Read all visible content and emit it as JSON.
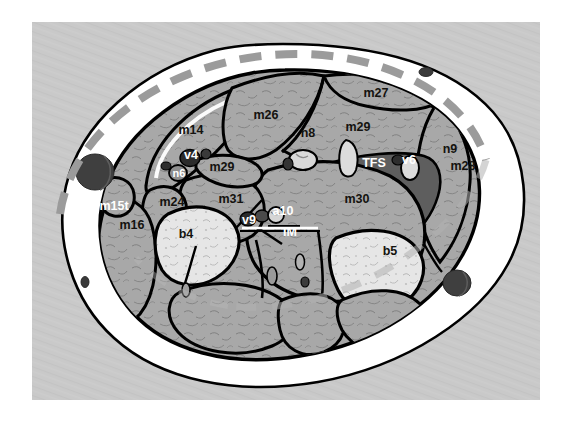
{
  "figure": {
    "background_color": "#ffffff",
    "panel_color": "#c9c9c9",
    "panel_rect": {
      "x": 32,
      "y": 22,
      "width": 508,
      "height": 378
    },
    "outline_color": "#000000",
    "skin_fill": "#ffffff",
    "muscle_fill": "#a8a8a8",
    "bone_fill": "#e3e3e3",
    "fascia_fill": "#6f6f6f",
    "vessel_dark": "#3a3a3a",
    "dashed_marker_color": "#9b9b9b"
  },
  "labels": {
    "dark": [
      {
        "id": "m14",
        "text": "m14",
        "x": 191,
        "y": 134
      },
      {
        "id": "m26",
        "text": "m26",
        "x": 266,
        "y": 119
      },
      {
        "id": "m27",
        "text": "m27",
        "x": 376,
        "y": 97
      },
      {
        "id": "n8",
        "text": "n8",
        "x": 308,
        "y": 137
      },
      {
        "id": "m29-upper",
        "text": "m29",
        "x": 358,
        "y": 131
      },
      {
        "id": "n9",
        "text": "n9",
        "x": 450,
        "y": 153
      },
      {
        "id": "m28",
        "text": "m28",
        "x": 463,
        "y": 170
      },
      {
        "id": "m29-lower",
        "text": "m29",
        "x": 222,
        "y": 171
      },
      {
        "id": "m31",
        "text": "m31",
        "x": 231,
        "y": 203
      },
      {
        "id": "m30",
        "text": "m30",
        "x": 357,
        "y": 203
      },
      {
        "id": "m24",
        "text": "m24",
        "x": 172,
        "y": 206
      },
      {
        "id": "m16",
        "text": "m16",
        "x": 132,
        "y": 229
      },
      {
        "id": "b4",
        "text": "b4",
        "x": 186,
        "y": 238
      },
      {
        "id": "b5",
        "text": "b5",
        "x": 390,
        "y": 255
      }
    ],
    "light": [
      {
        "id": "v4",
        "text": "v4",
        "x": 191,
        "y": 159
      },
      {
        "id": "n6",
        "text": "n6",
        "x": 179,
        "y": 173
      },
      {
        "id": "TFS",
        "text": "TFS",
        "x": 374,
        "y": 163
      },
      {
        "id": "v6",
        "text": "v6",
        "x": 409,
        "y": 162
      },
      {
        "id": "m15t",
        "text": "m15t",
        "x": 114,
        "y": 206
      },
      {
        "id": "v9",
        "text": "v9",
        "x": 249,
        "y": 221
      },
      {
        "id": "a10",
        "text": "a10",
        "x": 283,
        "y": 214
      },
      {
        "id": "IM",
        "text": "IM",
        "x": 290,
        "y": 232
      }
    ]
  },
  "markers": {
    "dashed_line_note": "thick gray dashed arc along upper-left perimeter",
    "dark_ellipses": [
      {
        "id": "vessel-left-large",
        "cx": 95,
        "cy": 172,
        "rx": 19,
        "ry": 18
      },
      {
        "id": "vessel-right-large",
        "cx": 457,
        "cy": 283,
        "rx": 14,
        "ry": 13
      },
      {
        "id": "vessel-top-right-small",
        "cx": 426,
        "cy": 72,
        "rx": 7,
        "ry": 4.5
      },
      {
        "id": "vessel-bottom-left-small",
        "cx": 85,
        "cy": 282,
        "rx": 4,
        "ry": 5.5
      }
    ]
  }
}
